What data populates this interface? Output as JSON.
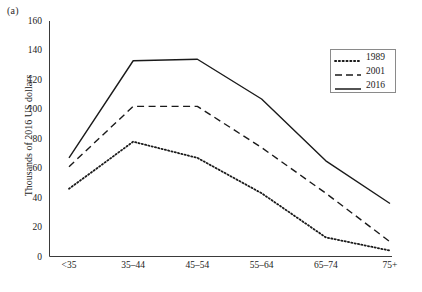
{
  "figure": {
    "panel_label": "(a)"
  },
  "chart_data": {
    "type": "line",
    "title": "",
    "xlabel": "Age group",
    "ylabel": "Thousands of 2016 US dollars",
    "categories": [
      "<35",
      "35–44",
      "45–54",
      "55–64",
      "65–74",
      "75+"
    ],
    "ylim": [
      0,
      160
    ],
    "yticks": [
      0,
      20,
      40,
      60,
      80,
      100,
      120,
      140,
      160
    ],
    "ytick_labels": [
      "0",
      "20",
      "40",
      "60",
      "80",
      "100",
      "120",
      "140",
      "160"
    ],
    "grid": false,
    "legend_position": "upper right",
    "series": [
      {
        "name": "1989",
        "style": "dotted",
        "color": "#1a1a1a",
        "values": [
          46,
          78,
          67,
          43,
          13,
          4
        ]
      },
      {
        "name": "2001",
        "style": "dashed",
        "color": "#1a1a1a",
        "values": [
          61,
          102,
          102,
          74,
          43,
          10
        ]
      },
      {
        "name": "2016",
        "style": "solid",
        "color": "#1a1a1a",
        "values": [
          67,
          133,
          134,
          107,
          65,
          36
        ]
      }
    ]
  }
}
